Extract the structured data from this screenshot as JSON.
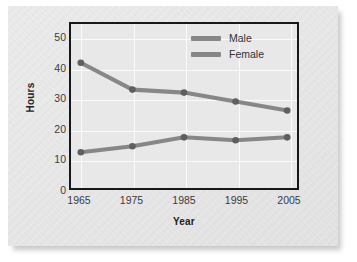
{
  "chart_data": {
    "type": "line",
    "title": "",
    "xlabel": "Year",
    "ylabel": "Hours",
    "categories": [
      "1965",
      "1975",
      "1985",
      "1995",
      "2005"
    ],
    "x": [
      1965,
      1975,
      1985,
      1995,
      2005
    ],
    "series": [
      {
        "name": "Male",
        "values": [
          42,
          33,
          32,
          29,
          26
        ],
        "color": "#878787"
      },
      {
        "name": "Female",
        "values": [
          12,
          14,
          17,
          16,
          17
        ],
        "color": "#878787"
      }
    ],
    "ylim": [
      0,
      55
    ],
    "yticks": [
      50,
      40,
      30,
      20,
      10,
      0
    ],
    "xlim": [
      1960,
      2010
    ],
    "grid": true,
    "legend_position": "top-center-inside",
    "marker": "circle",
    "marker_color": "#5f5f5f",
    "plot_background": "#e8e8e9",
    "gridline_color": "#fbfbfb",
    "frame_color": "#16181a",
    "page_background": "#ececed"
  }
}
